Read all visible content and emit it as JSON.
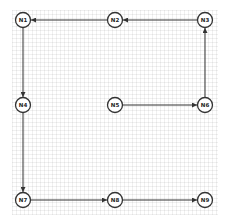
{
  "diagram": {
    "type": "directed-graph",
    "colors": {
      "stroke": "#333333",
      "node_fill": "#ffffff",
      "background": "#ffffff"
    },
    "nodes": [
      {
        "id": "N1",
        "label": "N1",
        "x": 23,
        "y": 20
      },
      {
        "id": "N2",
        "label": "N2",
        "x": 115,
        "y": 20
      },
      {
        "id": "N3",
        "label": "N3",
        "x": 205,
        "y": 20
      },
      {
        "id": "N4",
        "label": "N4",
        "x": 23,
        "y": 105
      },
      {
        "id": "N5",
        "label": "N5",
        "x": 115,
        "y": 105
      },
      {
        "id": "N6",
        "label": "N6",
        "x": 205,
        "y": 105
      },
      {
        "id": "N7",
        "label": "N7",
        "x": 23,
        "y": 200
      },
      {
        "id": "N8",
        "label": "N8",
        "x": 115,
        "y": 200
      },
      {
        "id": "N9",
        "label": "N9",
        "x": 205,
        "y": 200
      }
    ],
    "edges": [
      {
        "from": "N2",
        "to": "N1"
      },
      {
        "from": "N3",
        "to": "N2"
      },
      {
        "from": "N1",
        "to": "N4"
      },
      {
        "from": "N4",
        "to": "N7"
      },
      {
        "from": "N5",
        "to": "N6"
      },
      {
        "from": "N6",
        "to": "N3"
      },
      {
        "from": "N7",
        "to": "N8"
      },
      {
        "from": "N8",
        "to": "N9"
      }
    ]
  }
}
